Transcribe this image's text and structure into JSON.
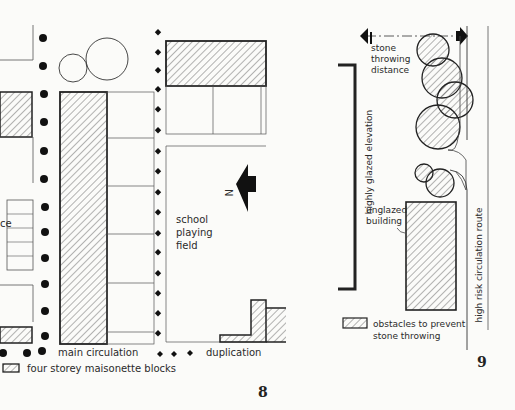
{
  "figure8": {
    "number": "8",
    "labels": {
      "field_line1": "school",
      "field_line2": "playing",
      "field_line3": "field",
      "north": "N",
      "cropped_text": "ce"
    },
    "legend": {
      "main_circulation": "main circulation",
      "duplication": "duplication",
      "maisonette_blocks": "four storey maisonette blocks"
    }
  },
  "figure9": {
    "number": "9",
    "labels": {
      "stone_line1": "stone",
      "stone_line2": "throwing",
      "stone_line3": "distance",
      "glazed_elevation": "highly glazed elevation",
      "unglazed_line1": "unglazed",
      "unglazed_line2": "building",
      "route": "high risk circulation route"
    },
    "legend": {
      "obstacles_line1": "obstacles to prevent",
      "obstacles_line2": "stone throwing"
    }
  },
  "colors": {
    "ink": "#222222",
    "line": "#555555",
    "paper": "#fbfbf9"
  }
}
